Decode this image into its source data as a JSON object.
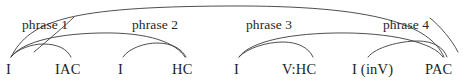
{
  "diagram": {
    "kind": "harmonic-phrase-arc-diagram",
    "width": 471,
    "height": 80,
    "background_color": "#ffffff",
    "stroke_color": "#3a3a3c",
    "text_color": "#1e1e22",
    "phrase_labels": [
      {
        "id": "phrase-1",
        "text": "phrase 1",
        "x": 22,
        "y": 18
      },
      {
        "id": "phrase-2",
        "text": "phrase 2",
        "x": 132,
        "y": 18
      },
      {
        "id": "phrase-3",
        "text": "phrase 3",
        "x": 246,
        "y": 18
      },
      {
        "id": "phrase-4",
        "text": "phrase 4",
        "x": 383,
        "y": 18
      }
    ],
    "terminals": [
      {
        "id": "terminal-i-1",
        "text": "I",
        "x": 6,
        "y": 62,
        "anchor_x": 11
      },
      {
        "id": "terminal-iac",
        "text": "IAC",
        "x": 55,
        "y": 62,
        "anchor_x": 71
      },
      {
        "id": "terminal-i-2",
        "text": "I",
        "x": 118,
        "y": 62,
        "anchor_x": 123
      },
      {
        "id": "terminal-hc",
        "text": "HC",
        "x": 172,
        "y": 62,
        "anchor_x": 186
      },
      {
        "id": "terminal-i-3",
        "text": "I",
        "x": 234,
        "y": 62,
        "anchor_x": 239
      },
      {
        "id": "terminal-vhc",
        "text": "V:HC",
        "x": 282,
        "y": 62,
        "anchor_x": 304
      },
      {
        "id": "terminal-i-inv",
        "text": "I (inV)",
        "x": 352,
        "y": 62,
        "anchor_x": 375
      },
      {
        "id": "terminal-pac",
        "text": "PAC",
        "x": 425,
        "y": 62,
        "anchor_x": 442
      }
    ],
    "arcs": [
      {
        "id": "arc-global-i1-pac",
        "from": "terminal-i-1",
        "to": "terminal-pac",
        "level": 3,
        "path": "M 11 57 C 30 20, 70 7, 226 6 C 380 5, 430 26, 444 57"
      },
      {
        "id": "arc-i1-hc",
        "from": "terminal-i-1",
        "to": "terminal-hc",
        "level": 2,
        "path": "M 11 57 C 20 44, 50 34, 100 33 C 150 32, 176 43, 185 57"
      },
      {
        "id": "arc-i3-pac",
        "from": "terminal-i-3",
        "to": "terminal-pac",
        "level": 2,
        "path": "M 239 57 C 248 44, 280 34, 335 33 C 392 32, 434 43, 443 57"
      },
      {
        "id": "arc-i1-iac",
        "from": "terminal-i-1",
        "to": "terminal-iac",
        "level": 1,
        "path": "M 11 57 C 17 49, 32 44, 43 44 C 58 44, 67 49, 71 57"
      },
      {
        "id": "arc-i2-hc",
        "from": "terminal-i-2",
        "to": "terminal-hc",
        "level": 1,
        "path": "M 123 57 C 129 48, 145 43, 157 43 C 172 43, 182 49, 186 57"
      },
      {
        "id": "arc-i3-vhc",
        "from": "terminal-i-3",
        "to": "terminal-vhc",
        "level": 1,
        "path": "M 239 57 C 247 48, 267 42, 283 42 C 298 42, 309 48, 313 57"
      },
      {
        "id": "arc-iinv-pac",
        "from": "terminal-i-inv",
        "to": "terminal-pac",
        "level": 1,
        "path": "M 368 57 C 376 47, 400 41, 418 41 C 434 41, 444 48, 447 57"
      }
    ],
    "connectors": [
      {
        "id": "connector-phrase-1",
        "from": "phrase-1",
        "to": "arc-i1-hc",
        "path": "M 74 17 C 66 25, 48 40, 34 52"
      },
      {
        "id": "connector-phrase-4",
        "from": "phrase-4",
        "to": "arc-i3-pac",
        "path": "M 430 18 C 440 26, 452 40, 458 52"
      }
    ]
  }
}
